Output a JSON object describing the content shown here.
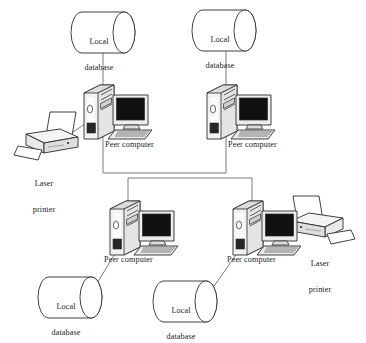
{
  "diagram": {
    "type": "network-diagram",
    "background_color": "#ffffff",
    "line_color": "#7d7d7d",
    "outline_color": "#2b2b2b",
    "text_color": "#1b1b1b",
    "screen_color": "#111111",
    "labels": {
      "local_database": "Local\ndatabase",
      "peer_computer": "Peer computer",
      "laser_printer": "Laser\nprinter"
    },
    "nodes": [
      {
        "id": "db-top-left",
        "kind": "database",
        "label": "Local\ndatabase",
        "label_line1": "Local",
        "label_line2": "database",
        "x": 70,
        "y": 12,
        "width": 66,
        "height": 41
      },
      {
        "id": "db-top-right",
        "kind": "database",
        "label": "Local\ndatabase",
        "label_line1": "Local",
        "label_line2": "database",
        "x": 191,
        "y": 10,
        "width": 66,
        "height": 41
      },
      {
        "id": "db-bottom-left",
        "kind": "database",
        "label": "Local\ndatabase",
        "label_line1": "Local",
        "label_line2": "database",
        "x": 37,
        "y": 277,
        "width": 66,
        "height": 41
      },
      {
        "id": "db-bottom-right",
        "kind": "database",
        "label": "Local\ndatabase",
        "label_line1": "Local",
        "label_line2": "database",
        "x": 152,
        "y": 281,
        "width": 66,
        "height": 41
      },
      {
        "id": "peer-top-left",
        "kind": "computer",
        "label": "Peer computer",
        "x": 82,
        "y": 83,
        "width": 72,
        "height": 56,
        "label_x": 103,
        "label_y": 141
      },
      {
        "id": "peer-top-right",
        "kind": "computer",
        "label": "Peer computer",
        "x": 214,
        "y": 83,
        "width": 72,
        "height": 56,
        "label_x": 226,
        "label_y": 141
      },
      {
        "id": "peer-bottom-left",
        "kind": "computer",
        "label": "Peer computer",
        "x": 108,
        "y": 199,
        "width": 72,
        "height": 56,
        "label_x": 103,
        "label_y": 257
      },
      {
        "id": "peer-bottom-right",
        "kind": "computer",
        "label": "Peer computer",
        "x": 231,
        "y": 199,
        "width": 72,
        "height": 56,
        "label_x": 226,
        "label_y": 257
      },
      {
        "id": "printer-left",
        "kind": "printer",
        "label": "Laser\nprinter",
        "label_line1": "Laser",
        "label_line2": "printer",
        "x": 14,
        "y": 112,
        "width": 66,
        "height": 42,
        "label_x": 21,
        "label_y": 163,
        "orientation": "right-facing"
      },
      {
        "id": "printer-right",
        "kind": "printer",
        "label": "Laser\nprinter",
        "label_line1": "Laser",
        "label_line2": "printer",
        "x": 289,
        "y": 196,
        "width": 66,
        "height": 42,
        "label_x": 297,
        "label_y": 243,
        "orientation": "left-facing"
      }
    ],
    "connections": [
      {
        "from": "db-top-left",
        "to": "peer-top-left",
        "kind": "vertical"
      },
      {
        "from": "db-top-right",
        "to": "peer-top-right",
        "kind": "vertical"
      },
      {
        "from": "peer-top-left",
        "to": "bus",
        "kind": "vertical"
      },
      {
        "from": "peer-top-right",
        "to": "bus",
        "kind": "vertical"
      },
      {
        "from": "bus",
        "to": "peer-bottom-left",
        "kind": "vertical"
      },
      {
        "from": "bus",
        "to": "peer-bottom-right",
        "kind": "vertical"
      },
      {
        "from": "printer-left",
        "to": "peer-top-left",
        "kind": "diagonal"
      },
      {
        "from": "printer-right",
        "to": "peer-bottom-right",
        "kind": "diagonal"
      },
      {
        "from": "db-bottom-left",
        "to": "peer-bottom-left",
        "kind": "diagonal"
      },
      {
        "from": "db-bottom-right",
        "to": "peer-bottom-right",
        "kind": "diagonal"
      }
    ]
  }
}
